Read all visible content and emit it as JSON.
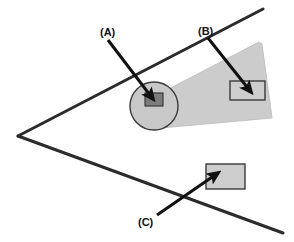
{
  "figure": {
    "canvas": {
      "width": 294,
      "height": 242,
      "background": "#ffffff"
    },
    "colors": {
      "line_stroke": "#2b2b2b",
      "cone_fill": "#cccccc",
      "cone_stroke": "#c2c2c2",
      "circle_fill": "#c8c8c8",
      "circle_stroke": "#3a3a3a",
      "dark_rect_fill": "#7b7b7b",
      "dark_rect_stroke": "#3a3a3a",
      "light_rect_fill": "#cdcdcd",
      "light_rect_stroke": "#3a3a3a",
      "arrow_color": "#111111",
      "label_color": "#111111"
    },
    "callouts": [
      {
        "id": "a",
        "label": "(A)",
        "label_x": 100,
        "label_y": 36,
        "arrow_from_x": 108,
        "arrow_from_y": 40,
        "arrow_to_x": 153,
        "arrow_to_y": 99,
        "target": "circle-with-dark-rectangle"
      },
      {
        "id": "b",
        "label": "(B)",
        "label_x": 198,
        "label_y": 35,
        "arrow_from_x": 208,
        "arrow_from_y": 38,
        "arrow_to_x": 251,
        "arrow_to_y": 92,
        "target": "upper-light-rectangle"
      },
      {
        "id": "c",
        "label": "(C)",
        "label_x": 138,
        "label_y": 226,
        "arrow_from_x": 157,
        "arrow_from_y": 215,
        "arrow_to_x": 218,
        "arrow_to_y": 173,
        "target": "lower-light-rectangle"
      }
    ],
    "shapes": {
      "v_lines": {
        "name": "open-angle-lines",
        "vertex_x": 18,
        "vertex_y": 136,
        "upper_end_x": 263,
        "upper_end_y": 9,
        "lower_end_x": 283,
        "lower_end_y": 233,
        "stroke_width": 3
      },
      "cone": {
        "name": "shaded-cone-wedge",
        "points": "159,94 259,42 262,44 272,118 161,128"
      },
      "circle": {
        "name": "shaded-circle",
        "cx": 154,
        "cy": 106,
        "r": 24
      },
      "dark_rect": {
        "name": "dark-rectangle",
        "x": 145,
        "y": 93,
        "width": 18,
        "height": 13
      },
      "upper_rect": {
        "name": "upper-light-rectangle",
        "x": 230,
        "y": 81,
        "width": 35,
        "height": 19
      },
      "lower_rect": {
        "name": "lower-light-rectangle",
        "x": 206,
        "y": 164,
        "width": 39,
        "height": 25
      }
    }
  }
}
